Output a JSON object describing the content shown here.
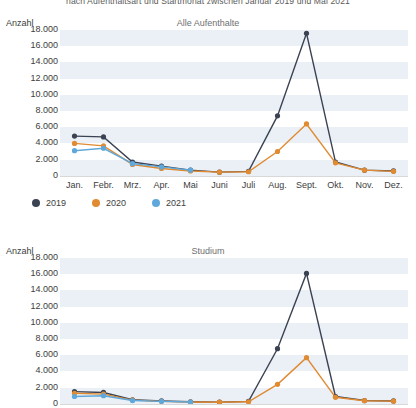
{
  "header": {
    "subtitle": "nach Aufenthaltsart und Startmonat zwischen Januar 2019 und Mai 2021"
  },
  "axis": {
    "y_title": "Anzahl",
    "yticks": [
      "18.000",
      "16.000",
      "14.000",
      "12.000",
      "10.000",
      "8.000",
      "6.000",
      "4.000",
      "2.000",
      "0"
    ],
    "xticks": [
      "Jan.",
      "Febr.",
      "Mrz.",
      "Apr.",
      "Mai",
      "Juni",
      "Juli",
      "Aug.",
      "Sept.",
      "Okt.",
      "Nov.",
      "Dez."
    ]
  },
  "legend": {
    "items": [
      {
        "label": "2019",
        "color": "#3b4252"
      },
      {
        "label": "2020",
        "color": "#e08a32"
      },
      {
        "label": "2021",
        "color": "#5fa8dc"
      }
    ]
  },
  "colors": {
    "series_2019": "#3b4252",
    "series_2020": "#e08a32",
    "series_2021": "#5fa8dc",
    "band": "#eaf0f6",
    "axis": "#d8d8d8",
    "title_text": "#6f6f6f",
    "body_text": "#3d3d3d"
  },
  "chart_data": [
    {
      "type": "line",
      "title": "Alle Aufenthalte",
      "xlabel": "",
      "ylabel": "Anzahl",
      "ylim": [
        0,
        18000
      ],
      "ytick_step": 2000,
      "grid": true,
      "legend_position": "bottom-left",
      "categories": [
        "Jan.",
        "Febr.",
        "Mrz.",
        "Apr.",
        "Mai",
        "Juni",
        "Juli",
        "Aug.",
        "Sept.",
        "Okt.",
        "Nov.",
        "Dez."
      ],
      "series": [
        {
          "name": "2019",
          "color": "#3b4252",
          "values": [
            4900,
            4800,
            1700,
            1200,
            700,
            450,
            550,
            7400,
            17600,
            1700,
            700,
            600
          ]
        },
        {
          "name": "2020",
          "color": "#e08a32",
          "values": [
            4000,
            3700,
            1400,
            900,
            600,
            450,
            500,
            3000,
            6400,
            1600,
            700,
            550
          ]
        },
        {
          "name": "2021",
          "color": "#5fa8dc",
          "values": [
            3100,
            3400,
            1500,
            1100,
            700,
            null,
            null,
            null,
            null,
            null,
            null,
            null
          ]
        }
      ]
    },
    {
      "type": "line",
      "title": "Studium",
      "xlabel": "",
      "ylabel": "Anzahl",
      "ylim": [
        0,
        18000
      ],
      "ytick_step": 2000,
      "grid": true,
      "legend_position": "none",
      "categories": [
        "Jan.",
        "Febr.",
        "Mrz.",
        "Apr.",
        "Mai",
        "Juni",
        "Juli",
        "Aug.",
        "Sept.",
        "Okt.",
        "Nov.",
        "Dez."
      ],
      "series": [
        {
          "name": "2019",
          "color": "#3b4252",
          "values": [
            1500,
            1400,
            500,
            350,
            250,
            200,
            300,
            6800,
            16100,
            900,
            400,
            350
          ]
        },
        {
          "name": "2020",
          "color": "#e08a32",
          "values": [
            1300,
            1200,
            450,
            300,
            220,
            200,
            250,
            2400,
            5700,
            800,
            380,
            330
          ]
        },
        {
          "name": "2021",
          "color": "#5fa8dc",
          "values": [
            900,
            1000,
            400,
            300,
            220,
            null,
            null,
            null,
            null,
            null,
            null,
            null
          ]
        }
      ]
    }
  ]
}
